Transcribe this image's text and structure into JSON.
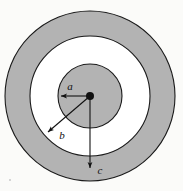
{
  "figure": {
    "background_color": "#fbfbf9",
    "shading_color": "#b3b3b3",
    "outline_color": "#1a1a1a",
    "white_color": "#ffffff",
    "center": {
      "x": 90,
      "y": 96
    },
    "regions": [
      {
        "name": "inner-conductor",
        "shape": "disk",
        "radius": 32,
        "fill": "shaded",
        "fill_color": "#b3b3b3"
      },
      {
        "name": "insulating-gap",
        "shape": "annulus",
        "inner_radius": 32,
        "outer_radius": 60,
        "fill": "white",
        "fill_color": "#ffffff"
      },
      {
        "name": "outer-conductor-shell",
        "shape": "annulus",
        "inner_radius": 60,
        "outer_radius": 85,
        "fill": "shaded",
        "fill_color": "#b3b3b3"
      }
    ],
    "center_dot": {
      "name": "center-point",
      "radius": 4,
      "color": "#111111"
    },
    "radius_arrows": [
      {
        "id": "a",
        "label": "a",
        "describes": "radius of inner shaded disk",
        "angle_deg": 180,
        "length": 31,
        "tip": {
          "x": 59,
          "y": 96
        },
        "label_pos": {
          "x": 70,
          "y": 89
        }
      },
      {
        "id": "b",
        "label": "b",
        "describes": "inner radius of outer shaded ring",
        "angle_deg": 222,
        "length": 59,
        "tip": {
          "x": 46,
          "y": 134
        },
        "label_pos": {
          "x": 61,
          "y": 137
        }
      },
      {
        "id": "c",
        "label": "c",
        "describes": "outer radius of outer shaded ring",
        "angle_deg": 90,
        "length": 74,
        "tip": {
          "x": 90,
          "y": 170
        },
        "label_pos": {
          "x": 98,
          "y": 171
        }
      }
    ],
    "artifacts": [
      {
        "name": "scan-speck",
        "x": 9,
        "y": 179
      }
    ]
  }
}
